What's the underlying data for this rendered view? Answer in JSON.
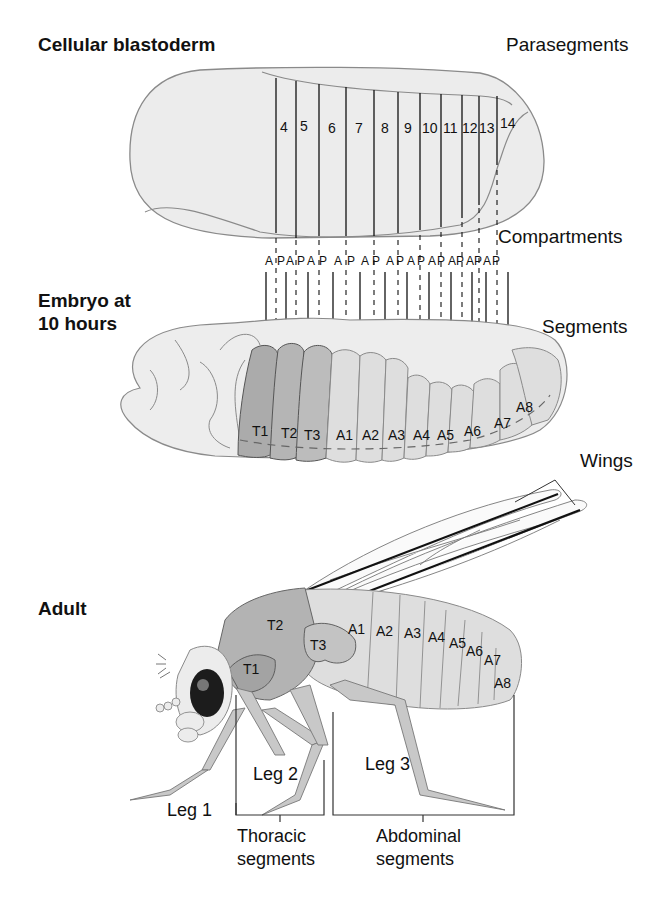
{
  "stages": {
    "blastoderm": "Cellular blastoderm",
    "embryo_line1": "Embryo at",
    "embryo_line2": "10 hours",
    "adult": "Adult"
  },
  "side_labels": {
    "parasegments": "Parasegments",
    "compartments": "Compartments",
    "segments": "Segments",
    "wings": "Wings"
  },
  "parasegments": [
    "4",
    "5",
    "6",
    "7",
    "8",
    "9",
    "10",
    "11",
    "12",
    "13",
    "14"
  ],
  "compartments": [
    "A",
    "P",
    "A",
    "P",
    "A",
    "P",
    "A",
    "P",
    "A",
    "P",
    "A",
    "P",
    "A",
    "P",
    "A",
    "P",
    "A",
    "P",
    "A",
    "P",
    "A",
    "P"
  ],
  "embryo_segments": [
    "T1",
    "T2",
    "T3",
    "A1",
    "A2",
    "A3",
    "A4",
    "A5",
    "A6",
    "A7",
    "A8"
  ],
  "adult_segments": {
    "thorax": [
      "T1",
      "T2",
      "T3"
    ],
    "abdomen": [
      "A1",
      "A2",
      "A3",
      "A4",
      "A5",
      "A6",
      "A7",
      "A8"
    ]
  },
  "legs": [
    "Leg 1",
    "Leg 2",
    "Leg 3"
  ],
  "brackets": {
    "thoracic_line1": "Thoracic",
    "thoracic_line2": "segments",
    "abdominal_line1": "Abdominal",
    "abdominal_line2": "segments"
  },
  "colors": {
    "light_fill": "#ebebeb",
    "thorax_dark": "#a8a8a8",
    "thorax_mid": "#bdbdbd",
    "abdomen_fill": "#dcdcdc",
    "outline": "#8a8a8a"
  }
}
